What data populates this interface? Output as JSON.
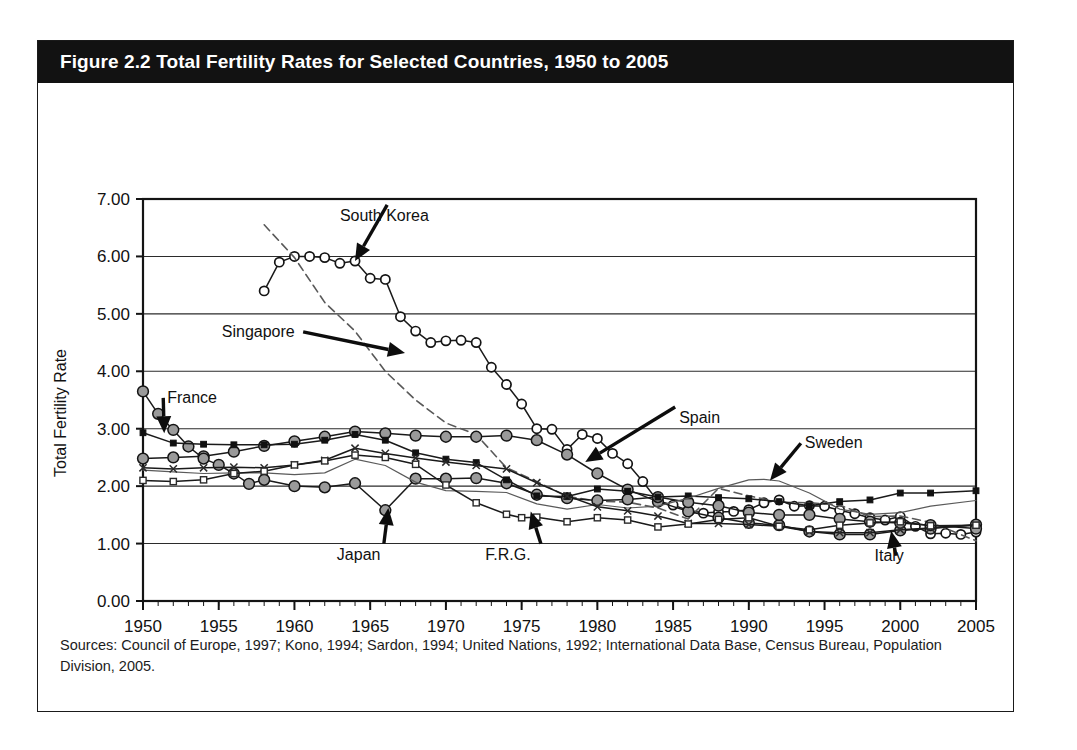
{
  "figure": {
    "title": "Figure 2.2 Total Fertility Rates for Selected Countries, 1950 to 2005",
    "source": "Sources: Council of Europe, 1997; Kono, 1994; Sardon, 1994; United Nations, 1992; International Data Base, Census Bureau, Population Division, 2005."
  },
  "chart_data": {
    "type": "line",
    "title": "Figure 2.2 Total Fertility Rates for Selected Countries, 1950 to 2005",
    "xlabel": "",
    "ylabel": "Total Fertility Rate",
    "xlim": [
      1950,
      2005
    ],
    "ylim": [
      0.0,
      7.0
    ],
    "ytick_labels": [
      "0.00",
      "1.00",
      "2.00",
      "3.00",
      "4.00",
      "5.00",
      "6.00",
      "7.00"
    ],
    "ytick_values": [
      0,
      1,
      2,
      3,
      4,
      5,
      6,
      7
    ],
    "xtick_labels": [
      "1950",
      "1955",
      "1960",
      "1965",
      "1970",
      "1975",
      "1980",
      "1985",
      "1990",
      "1995",
      "2000",
      "2005"
    ],
    "xtick_values": [
      1950,
      1955,
      1960,
      1965,
      1970,
      1975,
      1980,
      1985,
      1990,
      1995,
      2000,
      2005
    ],
    "minor_xticks": "every 1 year",
    "grid": "horizontal gridlines at each 1.00",
    "legend": "none (series identified by arrow annotations)",
    "annotations": [
      {
        "label": "South Korea",
        "text_x": 1963.0,
        "text_y": 6.62,
        "point_x": 1964.0,
        "point_y": 5.92
      },
      {
        "label": "Singapore",
        "text_x": 1955.2,
        "text_y": 4.6,
        "point_x": 1967.3,
        "point_y": 4.32
      },
      {
        "label": "France",
        "text_x": 1951.6,
        "text_y": 3.45,
        "point_x": 1951.4,
        "point_y": 2.92
      },
      {
        "label": "Spain",
        "text_x": 1985.4,
        "text_y": 3.1,
        "point_x": 1979.2,
        "point_y": 2.42
      },
      {
        "label": "Sweden",
        "text_x": 1993.7,
        "text_y": 2.66,
        "point_x": 1991.4,
        "point_y": 2.1
      },
      {
        "label": "Japan",
        "text_x": 1962.8,
        "text_y": 0.72,
        "point_x": 1966.2,
        "point_y": 1.62
      },
      {
        "label": "F.R.G.",
        "text_x": 1972.6,
        "text_y": 0.72,
        "point_x": 1975.6,
        "point_y": 1.56
      },
      {
        "label": "Italy",
        "text_x": 1998.3,
        "text_y": 0.7,
        "point_x": 1999.4,
        "point_y": 1.22
      }
    ],
    "series": [
      {
        "name": "South Korea",
        "marker": "open-circle",
        "line": "solid",
        "x": [
          1958,
          1959,
          1960,
          1961,
          1962,
          1963,
          1964,
          1965,
          1966,
          1967,
          1968,
          1969,
          1970,
          1971,
          1972,
          1973,
          1974,
          1975,
          1976,
          1977,
          1978,
          1979,
          1980,
          1981,
          1982,
          1983,
          1984,
          1985,
          1986,
          1987,
          1988,
          1989,
          1990,
          1991,
          1992,
          1993,
          1994,
          1995,
          1996,
          1997,
          1998,
          1999,
          2000,
          2001,
          2002,
          2003,
          2004,
          2005
        ],
        "y": [
          5.4,
          5.9,
          6.0,
          6.0,
          5.98,
          5.88,
          5.92,
          5.62,
          5.6,
          4.95,
          4.7,
          4.5,
          4.53,
          4.54,
          4.5,
          4.07,
          3.77,
          3.43,
          3.0,
          2.99,
          2.64,
          2.9,
          2.83,
          2.57,
          2.39,
          2.08,
          1.74,
          1.67,
          1.58,
          1.53,
          1.55,
          1.56,
          1.59,
          1.71,
          1.76,
          1.65,
          1.66,
          1.65,
          1.58,
          1.52,
          1.45,
          1.41,
          1.47,
          1.3,
          1.17,
          1.18,
          1.16,
          1.2
        ]
      },
      {
        "name": "Singapore",
        "marker": "none",
        "line": "dashed",
        "x": [
          1958,
          1960,
          1962,
          1964,
          1966,
          1968,
          1970,
          1972,
          1974,
          1976,
          1978,
          1980,
          1982,
          1984,
          1986,
          1988,
          1990,
          1992,
          1994,
          1996,
          1998,
          2000,
          2002,
          2005
        ],
        "y": [
          6.55,
          5.98,
          5.2,
          4.7,
          4.0,
          3.5,
          3.1,
          2.9,
          2.32,
          2.08,
          1.82,
          1.74,
          1.72,
          1.62,
          1.43,
          1.96,
          1.83,
          1.72,
          1.71,
          1.67,
          1.47,
          1.48,
          1.37,
          1.05
        ]
      },
      {
        "name": "Spain",
        "marker": "gray-circle-large",
        "line": "solid",
        "x": [
          1950,
          1952,
          1954,
          1956,
          1958,
          1960,
          1962,
          1964,
          1966,
          1968,
          1970,
          1972,
          1974,
          1976,
          1978,
          1980,
          1982,
          1984,
          1986,
          1988,
          1990,
          1992,
          1994,
          1996,
          1998,
          2000,
          2002,
          2005
        ],
        "y": [
          2.48,
          2.5,
          2.52,
          2.6,
          2.7,
          2.78,
          2.86,
          2.95,
          2.92,
          2.88,
          2.86,
          2.86,
          2.88,
          2.8,
          2.55,
          2.22,
          1.94,
          1.73,
          1.56,
          1.45,
          1.36,
          1.32,
          1.21,
          1.16,
          1.16,
          1.23,
          1.26,
          1.33
        ]
      },
      {
        "name": "Japan",
        "marker": "gray-circle-large",
        "line": "solid",
        "x": [
          1950,
          1951,
          1952,
          1953,
          1954,
          1955,
          1956,
          1957,
          1958,
          1960,
          1962,
          1964,
          1966,
          1968,
          1970,
          1972,
          1974,
          1976,
          1978,
          1980,
          1982,
          1984,
          1986,
          1988,
          1990,
          1992,
          1994,
          1996,
          1998,
          2000,
          2002,
          2005
        ],
        "y": [
          3.65,
          3.26,
          2.98,
          2.69,
          2.48,
          2.37,
          2.22,
          2.04,
          2.11,
          2.0,
          1.98,
          2.05,
          1.58,
          2.13,
          2.13,
          2.14,
          2.05,
          1.85,
          1.79,
          1.75,
          1.77,
          1.81,
          1.72,
          1.66,
          1.54,
          1.5,
          1.5,
          1.43,
          1.38,
          1.36,
          1.32,
          1.26
        ]
      },
      {
        "name": "France",
        "marker": "black-square-small",
        "line": "solid",
        "x": [
          1950,
          1952,
          1954,
          1956,
          1958,
          1960,
          1962,
          1964,
          1966,
          1968,
          1970,
          1972,
          1974,
          1976,
          1978,
          1980,
          1982,
          1984,
          1986,
          1988,
          1990,
          1992,
          1994,
          1996,
          1998,
          2000,
          2002,
          2005
        ],
        "y": [
          2.93,
          2.75,
          2.73,
          2.72,
          2.72,
          2.73,
          2.8,
          2.9,
          2.8,
          2.58,
          2.47,
          2.41,
          2.11,
          1.83,
          1.82,
          1.95,
          1.91,
          1.81,
          1.83,
          1.8,
          1.78,
          1.73,
          1.66,
          1.73,
          1.76,
          1.88,
          1.88,
          1.92
        ]
      },
      {
        "name": "Sweden",
        "marker": "none",
        "line": "thin-solid",
        "x": [
          1950,
          1952,
          1954,
          1956,
          1958,
          1960,
          1962,
          1964,
          1966,
          1968,
          1970,
          1972,
          1974,
          1976,
          1978,
          1980,
          1982,
          1984,
          1986,
          1988,
          1990,
          1991,
          1992,
          1994,
          1996,
          1998,
          2000,
          2002,
          2005
        ],
        "y": [
          2.28,
          2.25,
          2.22,
          2.23,
          2.23,
          2.2,
          2.23,
          2.47,
          2.36,
          2.07,
          1.92,
          1.91,
          1.89,
          1.69,
          1.6,
          1.68,
          1.62,
          1.65,
          1.79,
          1.96,
          2.11,
          2.12,
          2.09,
          1.88,
          1.6,
          1.51,
          1.54,
          1.65,
          1.75
        ]
      },
      {
        "name": "Italy",
        "marker": "x-small",
        "line": "solid",
        "x": [
          1950,
          1952,
          1954,
          1956,
          1958,
          1960,
          1962,
          1964,
          1966,
          1968,
          1970,
          1972,
          1974,
          1976,
          1978,
          1980,
          1982,
          1984,
          1986,
          1988,
          1990,
          1992,
          1994,
          1996,
          1998,
          2000,
          2002,
          2005
        ],
        "y": [
          2.32,
          2.3,
          2.32,
          2.33,
          2.32,
          2.37,
          2.45,
          2.66,
          2.57,
          2.49,
          2.42,
          2.36,
          2.3,
          2.06,
          1.83,
          1.64,
          1.57,
          1.48,
          1.35,
          1.35,
          1.33,
          1.3,
          1.21,
          1.19,
          1.19,
          1.24,
          1.27,
          1.32
        ]
      },
      {
        "name": "F.R.G.",
        "marker": "open-square-small",
        "line": "solid",
        "x": [
          1950,
          1952,
          1954,
          1956,
          1958,
          1960,
          1962,
          1964,
          1966,
          1968,
          1970,
          1972,
          1974,
          1975,
          1976,
          1978,
          1980,
          1982,
          1984,
          1986,
          1988,
          1990,
          1992,
          1994,
          1996,
          1998,
          2000,
          2002,
          2005
        ],
        "y": [
          2.1,
          2.08,
          2.11,
          2.22,
          2.26,
          2.37,
          2.44,
          2.54,
          2.5,
          2.38,
          2.02,
          1.71,
          1.51,
          1.45,
          1.46,
          1.38,
          1.45,
          1.41,
          1.29,
          1.34,
          1.42,
          1.45,
          1.3,
          1.24,
          1.32,
          1.36,
          1.38,
          1.31,
          1.32
        ]
      }
    ]
  }
}
